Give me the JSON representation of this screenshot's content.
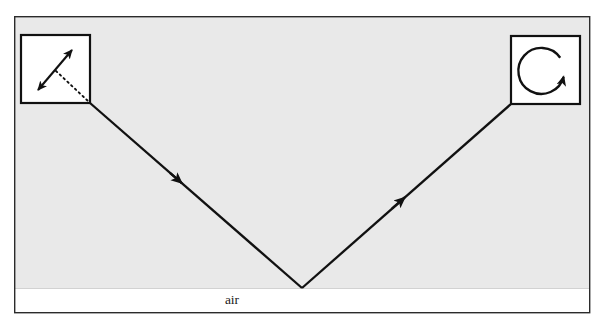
{
  "figure": {
    "name": "polarization-state-reflection-diagram",
    "caption_label": "air",
    "background_color": "#ffffff",
    "medium_fill_color": "#e9e9e9",
    "lower_medium_color": "#ffffff",
    "frame_color": "#2b2b2b",
    "ray_color": "#111111",
    "box_stroke_color": "#111111"
  },
  "frame": {
    "x": 14,
    "y": 16,
    "width": 576,
    "height": 297,
    "stroke_width": 1.4
  },
  "media": {
    "upper": {
      "name": "upper-medium-region",
      "label": "",
      "fill": "#e9e9e9",
      "top": 17,
      "bottom": 288
    },
    "lower": {
      "name": "lower-medium-region",
      "label": "air",
      "fill": "#ffffff",
      "top": 288,
      "bottom": 312
    },
    "interface_y": 288
  },
  "label": {
    "text": "air",
    "x": 232,
    "y": 304,
    "font_size": 13.5
  },
  "ray_path": {
    "name": "reflected-ray-path",
    "incoming": {
      "name": "incident-ray",
      "from_x": 90,
      "from_y": 103,
      "to_x": 302,
      "to_y": 288,
      "arrow_at_x": 180,
      "arrow_at_y": 185,
      "direction": "down-right"
    },
    "outgoing": {
      "name": "reflected-ray",
      "from_x": 302,
      "from_y": 288,
      "to_x": 511,
      "to_y": 104,
      "arrow_at_x": 404,
      "arrow_at_y": 198,
      "direction": "up-right"
    },
    "vertex_x": 302,
    "vertex_y": 288,
    "stroke_width": 2.3
  },
  "left_inset": {
    "name": "incident-polarization-inset",
    "x": 21,
    "y": 35,
    "width": 69,
    "height": 68,
    "stroke_width": 2.2,
    "polarization_type": "linear",
    "icon_name": "double-headed-arrow-icon",
    "arrow": {
      "tail_x": 37,
      "tail_y": 91,
      "head_x": 73,
      "head_y": 49,
      "stroke_width": 2.1
    },
    "dotted_ray": {
      "name": "ray-continuation-dotted",
      "from_x": 56,
      "from_y": 71,
      "to_x": 88,
      "to_y": 101,
      "dash_pattern": "1.6 3.4",
      "stroke_width": 1.8
    }
  },
  "right_inset": {
    "name": "reflected-polarization-inset",
    "x": 511,
    "y": 36,
    "width": 69,
    "height": 68,
    "stroke_width": 2.2,
    "polarization_type": "circular",
    "icon_name": "circular-arrow-icon",
    "circle": {
      "cx": 544,
      "cy": 71,
      "r": 23,
      "stroke_width": 2.4,
      "rotation_direction": "clockwise",
      "arrow_angle_deg": -40
    }
  }
}
